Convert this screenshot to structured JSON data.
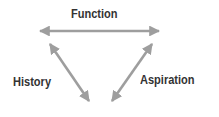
{
  "diagram": {
    "labels": {
      "top": "Function",
      "left": "History",
      "right": "Aspiration"
    },
    "arrow_color": "#9e9e9e",
    "text_color": "#333333",
    "edges": [
      {
        "from": "left-vertex",
        "to": "right-vertex",
        "label": "Function",
        "type": "double-arrow"
      },
      {
        "from": "left-vertex",
        "to": "bottom-vertex",
        "label": "History",
        "type": "double-arrow"
      },
      {
        "from": "right-vertex",
        "to": "bottom-vertex",
        "label": "Aspiration",
        "type": "double-arrow"
      }
    ]
  }
}
